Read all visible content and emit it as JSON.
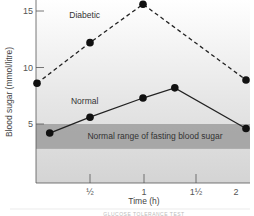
{
  "chart_data": {
    "type": "line",
    "title": "",
    "xlabel": "Time (h)",
    "ylabel": "Blood sugar (mmol/litre)",
    "xlim": [
      0,
      2.1
    ],
    "ylim": [
      0,
      15.5
    ],
    "x_ticks": [
      {
        "value": 0.5,
        "label": "½"
      },
      {
        "value": 1,
        "label": "1"
      },
      {
        "value": 1.5,
        "label": "1½"
      },
      {
        "value": 2,
        "label": "2"
      }
    ],
    "y_ticks": [
      {
        "value": 5,
        "label": "5"
      },
      {
        "value": 10,
        "label": "10"
      },
      {
        "value": 15,
        "label": "15"
      }
    ],
    "grid": false,
    "series": [
      {
        "name": "Diabetic",
        "style": "dashed",
        "color": "#222222",
        "points": [
          {
            "x": 0,
            "y": 8.6
          },
          {
            "x": 0.5,
            "y": 12.2
          },
          {
            "x": 1.0,
            "y": 15.6
          },
          {
            "x": 2.0,
            "y": 8.9
          }
        ]
      },
      {
        "name": "Normal",
        "style": "solid",
        "color": "#222222",
        "points": [
          {
            "x": 0.12,
            "y": 4.2
          },
          {
            "x": 0.5,
            "y": 5.6
          },
          {
            "x": 1.0,
            "y": 7.3
          },
          {
            "x": 1.3,
            "y": 8.2
          },
          {
            "x": 2.0,
            "y": 4.6
          }
        ]
      }
    ],
    "bands": [
      {
        "label": "Normal range of fasting blood sugar",
        "y_from": 2.8,
        "y_to": 5.0,
        "color": "#9e9e9e"
      }
    ],
    "annotations": [
      {
        "text": "Diabetic",
        "x": 0.45,
        "y": 14.4
      },
      {
        "text": "Normal",
        "x": 0.45,
        "y": 6.8
      }
    ],
    "caption": "GLUCOSE TOLERANCE TEST"
  }
}
